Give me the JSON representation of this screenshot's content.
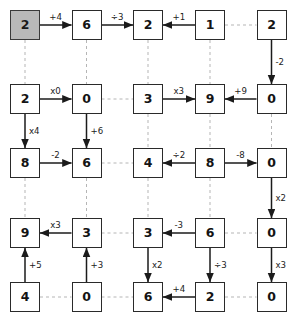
{
  "diagram": {
    "colors": {
      "node_fill": "#ffffff",
      "node_border": "#2a2a2a",
      "start_fill": "#b9b9b9",
      "solid_edge": "#1b1b1b",
      "dashed_edge": "#b5b5b5",
      "label_text": "#1b1b1b"
    },
    "grid": {
      "cols": 5,
      "rows": 5
    },
    "nodes": [
      {
        "id": "r1c1",
        "value": "2",
        "col": 1,
        "row": 1,
        "start": true
      },
      {
        "id": "r1c2",
        "value": "6",
        "col": 2,
        "row": 1,
        "start": false
      },
      {
        "id": "r1c3",
        "value": "2",
        "col": 3,
        "row": 1,
        "start": false
      },
      {
        "id": "r1c4",
        "value": "1",
        "col": 4,
        "row": 1,
        "start": false
      },
      {
        "id": "r1c5",
        "value": "2",
        "col": 5,
        "row": 1,
        "start": false
      },
      {
        "id": "r2c1",
        "value": "2",
        "col": 1,
        "row": 2,
        "start": false
      },
      {
        "id": "r2c2",
        "value": "0",
        "col": 2,
        "row": 2,
        "start": false
      },
      {
        "id": "r2c3",
        "value": "3",
        "col": 3,
        "row": 2,
        "start": false
      },
      {
        "id": "r2c4",
        "value": "9",
        "col": 4,
        "row": 2,
        "start": false
      },
      {
        "id": "r2c5",
        "value": "0",
        "col": 5,
        "row": 2,
        "start": false
      },
      {
        "id": "r3c1",
        "value": "8",
        "col": 1,
        "row": 3,
        "start": false
      },
      {
        "id": "r3c2",
        "value": "6",
        "col": 2,
        "row": 3,
        "start": false
      },
      {
        "id": "r3c3",
        "value": "4",
        "col": 3,
        "row": 3,
        "start": false
      },
      {
        "id": "r3c4",
        "value": "8",
        "col": 4,
        "row": 3,
        "start": false
      },
      {
        "id": "r3c5",
        "value": "0",
        "col": 5,
        "row": 3,
        "start": false
      },
      {
        "id": "r4c1",
        "value": "9",
        "col": 1,
        "row": 4,
        "start": false
      },
      {
        "id": "r4c2",
        "value": "3",
        "col": 2,
        "row": 4,
        "start": false
      },
      {
        "id": "r4c3",
        "value": "3",
        "col": 3,
        "row": 4,
        "start": false
      },
      {
        "id": "r4c4",
        "value": "6",
        "col": 4,
        "row": 4,
        "start": false
      },
      {
        "id": "r4c5",
        "value": "0",
        "col": 5,
        "row": 4,
        "start": false
      },
      {
        "id": "r5c1",
        "value": "4",
        "col": 1,
        "row": 5,
        "start": false
      },
      {
        "id": "r5c2",
        "value": "0",
        "col": 2,
        "row": 5,
        "start": false
      },
      {
        "id": "r5c3",
        "value": "6",
        "col": 3,
        "row": 5,
        "start": false
      },
      {
        "id": "r5c4",
        "value": "2",
        "col": 4,
        "row": 5,
        "start": false
      },
      {
        "id": "r5c5",
        "value": "0",
        "col": 5,
        "row": 5,
        "start": false
      }
    ],
    "edges": [
      {
        "from": "r1c1",
        "to": "r1c2",
        "label": "+4",
        "style": "solid",
        "dir": "right"
      },
      {
        "from": "r1c2",
        "to": "r1c3",
        "label": "÷3",
        "style": "solid",
        "dir": "right"
      },
      {
        "from": "r1c4",
        "to": "r1c3",
        "label": "+1",
        "style": "solid",
        "dir": "left"
      },
      {
        "from": "r1c4",
        "to": "r1c5",
        "label": "",
        "style": "dashed",
        "dir": "none"
      },
      {
        "from": "r2c1",
        "to": "r2c2",
        "label": "x0",
        "style": "solid",
        "dir": "right"
      },
      {
        "from": "r2c2",
        "to": "r2c3",
        "label": "",
        "style": "dashed",
        "dir": "none"
      },
      {
        "from": "r2c3",
        "to": "r2c4",
        "label": "x3",
        "style": "solid",
        "dir": "right"
      },
      {
        "from": "r2c5",
        "to": "r2c4",
        "label": "+9",
        "style": "solid",
        "dir": "left"
      },
      {
        "from": "r3c1",
        "to": "r3c2",
        "label": "-2",
        "style": "solid",
        "dir": "right"
      },
      {
        "from": "r3c2",
        "to": "r3c3",
        "label": "",
        "style": "dashed",
        "dir": "none"
      },
      {
        "from": "r3c4",
        "to": "r3c3",
        "label": "÷2",
        "style": "solid",
        "dir": "left"
      },
      {
        "from": "r3c4",
        "to": "r3c5",
        "label": "-8",
        "style": "solid",
        "dir": "right"
      },
      {
        "from": "r4c2",
        "to": "r4c1",
        "label": "x3",
        "style": "solid",
        "dir": "left"
      },
      {
        "from": "r4c2",
        "to": "r4c3",
        "label": "",
        "style": "dashed",
        "dir": "none"
      },
      {
        "from": "r4c4",
        "to": "r4c3",
        "label": "-3",
        "style": "solid",
        "dir": "left"
      },
      {
        "from": "r4c4",
        "to": "r4c5",
        "label": "",
        "style": "dashed",
        "dir": "none"
      },
      {
        "from": "r5c1",
        "to": "r5c2",
        "label": "",
        "style": "dashed",
        "dir": "none"
      },
      {
        "from": "r5c2",
        "to": "r5c3",
        "label": "",
        "style": "dashed",
        "dir": "none"
      },
      {
        "from": "r5c4",
        "to": "r5c3",
        "label": "+4",
        "style": "solid",
        "dir": "left"
      },
      {
        "from": "r5c4",
        "to": "r5c5",
        "label": "",
        "style": "dashed",
        "dir": "none"
      },
      {
        "from": "r1c1",
        "to": "r2c1",
        "label": "",
        "style": "dashed",
        "dir": "none"
      },
      {
        "from": "r2c1",
        "to": "r3c1",
        "label": "x4",
        "style": "solid",
        "dir": "down"
      },
      {
        "from": "r3c1",
        "to": "r4c1",
        "label": "",
        "style": "dashed",
        "dir": "none"
      },
      {
        "from": "r5c1",
        "to": "r4c1",
        "label": "+5",
        "style": "solid",
        "dir": "up"
      },
      {
        "from": "r1c2",
        "to": "r2c2",
        "label": "",
        "style": "dashed",
        "dir": "none"
      },
      {
        "from": "r2c2",
        "to": "r3c2",
        "label": "+6",
        "style": "solid",
        "dir": "down"
      },
      {
        "from": "r3c2",
        "to": "r4c2",
        "label": "",
        "style": "dashed",
        "dir": "none"
      },
      {
        "from": "r5c2",
        "to": "r4c2",
        "label": "+3",
        "style": "solid",
        "dir": "up"
      },
      {
        "from": "r1c3",
        "to": "r2c3",
        "label": "",
        "style": "dashed",
        "dir": "none"
      },
      {
        "from": "r2c3",
        "to": "r3c3",
        "label": "",
        "style": "dashed",
        "dir": "none"
      },
      {
        "from": "r3c3",
        "to": "r4c3",
        "label": "",
        "style": "dashed",
        "dir": "none"
      },
      {
        "from": "r4c3",
        "to": "r5c3",
        "label": "x2",
        "style": "solid",
        "dir": "down"
      },
      {
        "from": "r1c4",
        "to": "r2c4",
        "label": "",
        "style": "dashed",
        "dir": "none"
      },
      {
        "from": "r2c4",
        "to": "r3c4",
        "label": "",
        "style": "dashed",
        "dir": "none"
      },
      {
        "from": "r3c4",
        "to": "r4c4",
        "label": "",
        "style": "dashed",
        "dir": "none"
      },
      {
        "from": "r4c4",
        "to": "r5c4",
        "label": "÷3",
        "style": "solid",
        "dir": "down"
      },
      {
        "from": "r1c5",
        "to": "r2c5",
        "label": "-2",
        "style": "solid",
        "dir": "down"
      },
      {
        "from": "r2c5",
        "to": "r3c5",
        "label": "",
        "style": "dashed",
        "dir": "none"
      },
      {
        "from": "r3c5",
        "to": "r4c5",
        "label": "x2",
        "style": "solid",
        "dir": "down"
      },
      {
        "from": "r4c5",
        "to": "r5c5",
        "label": "x3",
        "style": "solid",
        "dir": "down"
      }
    ]
  }
}
